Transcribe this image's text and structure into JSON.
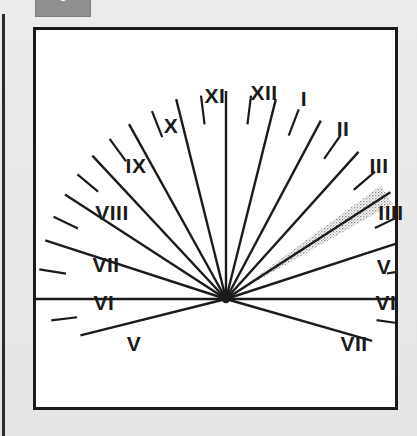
{
  "page": {
    "background_color": "#e8e8e8",
    "width": 417,
    "height": 436
  },
  "badge": {
    "label": "6",
    "fill_color": "#8f8f8f",
    "text_color": "#ffffff"
  },
  "figure": {
    "name": "sundial-hour-line-diagram",
    "frame_color": "#1a1a1a",
    "background_color": "#ffffff",
    "line_color": "#1b1b1b",
    "shadow_color": "#9a9a9a"
  },
  "chart_data": {
    "type": "scatter",
    "title": "",
    "subtitle": "",
    "xlabel": "",
    "ylabel": "",
    "center": {
      "x": 190,
      "y": 269
    },
    "legend": [],
    "grid": false,
    "hour_lines": [
      {
        "label": "XII",
        "angle_deg": -90.0,
        "radius": 208,
        "kind": "hour"
      },
      {
        "label": "XI",
        "angle_deg": -104.0,
        "radius": 206,
        "kind": "hour"
      },
      {
        "label": "X",
        "angle_deg": -119.0,
        "radius": 200,
        "kind": "hour"
      },
      {
        "label": "IX",
        "angle_deg": -133.0,
        "radius": 196,
        "kind": "hour"
      },
      {
        "label": "VIII",
        "angle_deg": -147.0,
        "radius": 192,
        "kind": "hour"
      },
      {
        "label": "VII",
        "angle_deg": -162.0,
        "radius": 190,
        "kind": "hour"
      },
      {
        "label": "VI",
        "angle_deg": 180.0,
        "radius": 190,
        "kind": "hour"
      },
      {
        "label": "V",
        "angle_deg": 166.0,
        "radius": 150,
        "kind": "hour"
      },
      {
        "label": "I",
        "angle_deg": -76.0,
        "radius": 206,
        "kind": "hour"
      },
      {
        "label": "II",
        "angle_deg": -62.0,
        "radius": 202,
        "kind": "hour"
      },
      {
        "label": "III",
        "angle_deg": -48.0,
        "radius": 198,
        "kind": "hour"
      },
      {
        "label": "IIII",
        "angle_deg": -33.0,
        "radius": 196,
        "kind": "hour"
      },
      {
        "label": "V",
        "angle_deg": -18.0,
        "radius": 193,
        "kind": "hour"
      },
      {
        "label": "VI",
        "angle_deg": 0.0,
        "radius": 190,
        "kind": "hour"
      },
      {
        "label": "VII",
        "angle_deg": 16.0,
        "radius": 152,
        "kind": "hour"
      }
    ],
    "half_hour_ticks": [
      {
        "angle_deg": -97.0,
        "r_outer": 205,
        "r_inner": 176
      },
      {
        "angle_deg": -111.5,
        "r_outer": 202,
        "r_inner": 174
      },
      {
        "angle_deg": -126.0,
        "r_outer": 198,
        "r_inner": 170
      },
      {
        "angle_deg": -140.0,
        "r_outer": 194,
        "r_inner": 167
      },
      {
        "angle_deg": -154.5,
        "r_outer": 191,
        "r_inner": 164
      },
      {
        "angle_deg": -171.0,
        "r_outer": 189,
        "r_inner": 162
      },
      {
        "angle_deg": 173.0,
        "r_outer": 176,
        "r_inner": 150
      },
      {
        "angle_deg": -83.0,
        "r_outer": 205,
        "r_inner": 176
      },
      {
        "angle_deg": -69.0,
        "r_outer": 203,
        "r_inner": 175
      },
      {
        "angle_deg": -55.0,
        "r_outer": 199,
        "r_inner": 171
      },
      {
        "angle_deg": -40.5,
        "r_outer": 196,
        "r_inner": 168
      },
      {
        "angle_deg": -25.5,
        "r_outer": 193,
        "r_inner": 165
      },
      {
        "angle_deg": -9.0,
        "r_outer": 190,
        "r_inner": 163
      },
      {
        "angle_deg": 8.0,
        "r_outer": 178,
        "r_inner": 152
      }
    ],
    "shadow_wedge": {
      "name": "cast-shadow",
      "angle_deg": -33.0,
      "half_width_deg": 3.2,
      "length": 192,
      "style": "stippled"
    },
    "numerals": [
      {
        "text": "XI",
        "x": 179,
        "y": 65,
        "position": "top"
      },
      {
        "text": "XII",
        "x": 228,
        "y": 62,
        "position": "top"
      },
      {
        "text": "I",
        "x": 268,
        "y": 68,
        "position": "top"
      },
      {
        "text": "X",
        "x": 135,
        "y": 95,
        "position": "upper-left"
      },
      {
        "text": "II",
        "x": 307,
        "y": 98,
        "position": "upper-right"
      },
      {
        "text": "IX",
        "x": 100,
        "y": 135,
        "position": "upper-left"
      },
      {
        "text": "III",
        "x": 343,
        "y": 135,
        "position": "upper-right"
      },
      {
        "text": "VIII",
        "x": 76,
        "y": 182,
        "position": "left"
      },
      {
        "text": "IIII",
        "x": 355,
        "y": 182,
        "position": "right"
      },
      {
        "text": "VII",
        "x": 70,
        "y": 234,
        "position": "left"
      },
      {
        "text": "V",
        "x": 348,
        "y": 236,
        "position": "right"
      },
      {
        "text": "VI",
        "x": 68,
        "y": 272,
        "position": "left"
      },
      {
        "text": "VI",
        "x": 350,
        "y": 272,
        "position": "right"
      },
      {
        "text": "V",
        "x": 98,
        "y": 313,
        "position": "lower-left"
      },
      {
        "text": "VII",
        "x": 318,
        "y": 313,
        "position": "lower-right"
      }
    ]
  }
}
